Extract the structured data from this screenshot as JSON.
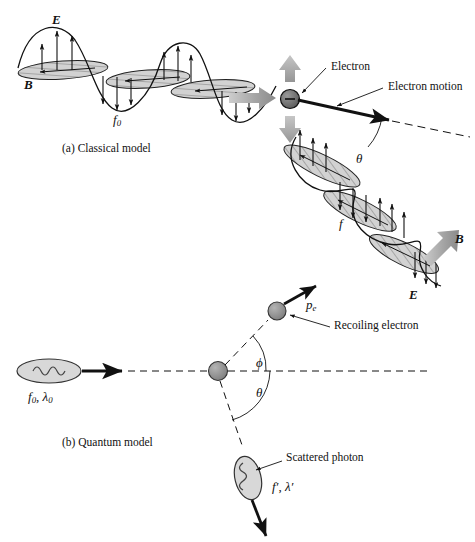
{
  "figure": {
    "captions": {
      "a": "(a) Classical model",
      "b": "(b) Quantum model"
    },
    "colors": {
      "ink": "#111111",
      "gray_arrow": "#a8a8a8",
      "gray_arrow_dark": "#8c8c8c",
      "particle_fill": "#8f8f8f",
      "electron_fill": "#6f6f6f",
      "photon_fill": "#d8d8d8",
      "lobe_fill": "#cfcfcf",
      "background": "#ffffff"
    },
    "panel_a": {
      "incident_wave": {
        "frequency_label": "f",
        "frequency_sub": "0",
        "e_field_label": "E",
        "b_field_label": "B",
        "e_field_name": "electric-field",
        "b_field_name": "magnetic-field"
      },
      "electron": {
        "charge_glyph": "–",
        "label": "Electron",
        "motion_label": "Electron motion",
        "oscillation_name": "oscillation-arrows"
      },
      "scattered_wave": {
        "frequency_label": "f",
        "e_field_label": "E",
        "b_field_label": "B"
      },
      "angle_label": "θ"
    },
    "panel_b": {
      "incident_photon": {
        "label_f": "f",
        "label_f_sub": "0",
        "separator": ", ",
        "label_lambda": "λ",
        "label_lambda_sub": "0"
      },
      "target_name": "stationary-electron",
      "recoil": {
        "momentum_label": "p",
        "momentum_sub": "e",
        "label": "Recoiling electron",
        "angle_label": "ϕ"
      },
      "scattered_photon": {
        "label": "Scattered photon",
        "label_f": "f′",
        "separator": ", ",
        "label_lambda": "λ′",
        "angle_label": "θ"
      }
    }
  }
}
